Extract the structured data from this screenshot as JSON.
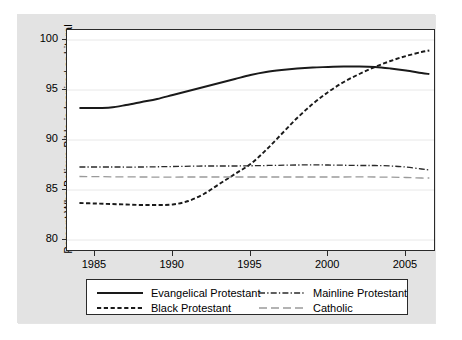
{
  "chart_data": {
    "type": "line",
    "title": "",
    "xlabel": "",
    "ylabel": "Percent Who Believe Bible is Inspired or Literal",
    "xlim": [
      1983.2,
      2006.8
    ],
    "ylim": [
      79.0,
      101.0
    ],
    "grid": true,
    "grid_axis": "y",
    "legend_position": "below-plot",
    "xticks": [
      1985,
      1990,
      1995,
      2000,
      2005
    ],
    "xtick_labels": [
      "1985",
      "1990",
      "1995",
      "2000",
      "2005"
    ],
    "yticks": [
      80,
      85,
      90,
      95,
      100
    ],
    "ytick_labels": [
      "80",
      "85",
      "90",
      "95",
      "100"
    ],
    "series": [
      {
        "name": "Evangelical Protestant",
        "style": "solid",
        "color": "#1a1a1a",
        "x": [
          1984,
          1985,
          1986,
          1987,
          1988,
          1989,
          1990,
          1991,
          1992,
          1993,
          1994,
          1995,
          1996,
          1997,
          1998,
          1999,
          2000,
          2001,
          2002,
          2003,
          2004,
          2005,
          2006,
          2006.5
        ],
        "values": [
          93.2,
          93.2,
          93.25,
          93.5,
          93.8,
          94.1,
          94.5,
          94.9,
          95.3,
          95.7,
          96.1,
          96.5,
          96.8,
          97.0,
          97.15,
          97.25,
          97.3,
          97.35,
          97.35,
          97.3,
          97.15,
          96.95,
          96.7,
          96.6
        ]
      },
      {
        "name": "Black Protestant",
        "style": "dashed",
        "color": "#1a1a1a",
        "x": [
          1984,
          1985,
          1986,
          1987,
          1988,
          1989,
          1990,
          1991,
          1992,
          1993,
          1994,
          1995,
          1996,
          1997,
          1998,
          1999,
          2000,
          2001,
          2002,
          2003,
          2004,
          2005,
          2006,
          2006.5
        ],
        "values": [
          83.7,
          83.65,
          83.6,
          83.55,
          83.5,
          83.5,
          83.55,
          83.9,
          84.6,
          85.6,
          86.6,
          87.6,
          89.0,
          90.6,
          92.2,
          93.6,
          94.8,
          95.8,
          96.6,
          97.3,
          97.9,
          98.4,
          98.8,
          98.95
        ]
      },
      {
        "name": "Mainline Protestant",
        "style": "dash-dot",
        "color": "#2a2a2a",
        "x": [
          1984,
          1986,
          1988,
          1990,
          1992,
          1994,
          1996,
          1998,
          2000,
          2002,
          2003,
          2004,
          2005,
          2006,
          2006.5
        ],
        "values": [
          87.3,
          87.3,
          87.3,
          87.35,
          87.4,
          87.4,
          87.45,
          87.5,
          87.5,
          87.45,
          87.45,
          87.4,
          87.3,
          87.1,
          87.0
        ]
      },
      {
        "name": "Catholic",
        "style": "long-dash",
        "color": "#9a9a9a",
        "x": [
          1984,
          1988,
          1992,
          1996,
          2000,
          2003,
          2005,
          2006,
          2006.5
        ],
        "values": [
          86.35,
          86.3,
          86.3,
          86.3,
          86.3,
          86.3,
          86.25,
          86.2,
          86.2
        ]
      }
    ]
  },
  "legend": {
    "entries": [
      {
        "label": "Evangelical Protestant",
        "style": "solid"
      },
      {
        "label": "Black Protestant",
        "style": "dashed"
      },
      {
        "label": "Mainline Protestant",
        "style": "dash-dot"
      },
      {
        "label": "Catholic",
        "style": "long-dash"
      }
    ]
  }
}
